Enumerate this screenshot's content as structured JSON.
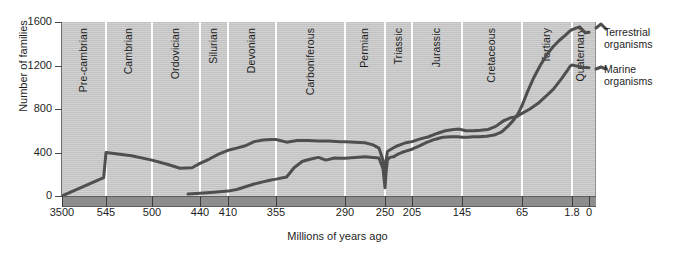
{
  "chart_data": {
    "type": "line",
    "title": "",
    "xlabel": "Millions of years ago",
    "ylabel": "Number of families",
    "ylim": [
      0,
      1600
    ],
    "y_ticks": [
      0,
      400,
      800,
      1200,
      1600
    ],
    "x_ticks": [
      "3500",
      "545",
      "500",
      "440",
      "410",
      "355",
      "290",
      "250",
      "205",
      "145",
      "65",
      "1.8",
      "0"
    ],
    "x_tick_values": [
      3500,
      545,
      500,
      440,
      410,
      355,
      290,
      250,
      205,
      145,
      65,
      1.8,
      0
    ],
    "x_axis_note": "Non-linear (piecewise) time axis: oldest at left, present at right",
    "grid": "vertical period dividers only",
    "legend_position": "right",
    "geologic_periods": [
      {
        "name": "Pre-cambrian",
        "start_ma": 3500,
        "end_ma": 545
      },
      {
        "name": "Cambrian",
        "start_ma": 545,
        "end_ma": 500
      },
      {
        "name": "Ordovician",
        "start_ma": 500,
        "end_ma": 440
      },
      {
        "name": "Silurian",
        "start_ma": 440,
        "end_ma": 410
      },
      {
        "name": "Devonian",
        "start_ma": 410,
        "end_ma": 355
      },
      {
        "name": "Carboniferous",
        "start_ma": 355,
        "end_ma": 290
      },
      {
        "name": "Permian",
        "start_ma": 290,
        "end_ma": 250
      },
      {
        "name": "Triassic",
        "start_ma": 250,
        "end_ma": 205
      },
      {
        "name": "Jurassic",
        "start_ma": 205,
        "end_ma": 145
      },
      {
        "name": "Cretaceous",
        "start_ma": 145,
        "end_ma": 65
      },
      {
        "name": "Tertiary",
        "start_ma": 65,
        "end_ma": 1.8
      },
      {
        "name": "Quaternary",
        "start_ma": 1.8,
        "end_ma": 0
      }
    ],
    "series": [
      {
        "name": "Marine organisms",
        "points": [
          [
            3500,
            0
          ],
          [
            700,
            170
          ],
          [
            545,
            400
          ],
          [
            520,
            370
          ],
          [
            500,
            330
          ],
          [
            480,
            290
          ],
          [
            465,
            255
          ],
          [
            450,
            260
          ],
          [
            440,
            300
          ],
          [
            430,
            340
          ],
          [
            420,
            385
          ],
          [
            410,
            420
          ],
          [
            400,
            440
          ],
          [
            390,
            462
          ],
          [
            380,
            500
          ],
          [
            370,
            515
          ],
          [
            360,
            520
          ],
          [
            355,
            520
          ],
          [
            345,
            495
          ],
          [
            335,
            510
          ],
          [
            325,
            510
          ],
          [
            315,
            505
          ],
          [
            305,
            505
          ],
          [
            295,
            500
          ],
          [
            290,
            500
          ],
          [
            280,
            495
          ],
          [
            270,
            490
          ],
          [
            262,
            470
          ],
          [
            256,
            440
          ],
          [
            252,
            330
          ],
          [
            250,
            195
          ],
          [
            248,
            330
          ],
          [
            246,
            410
          ],
          [
            240,
            430
          ],
          [
            232,
            455
          ],
          [
            225,
            470
          ],
          [
            215,
            490
          ],
          [
            205,
            500
          ],
          [
            195,
            525
          ],
          [
            185,
            545
          ],
          [
            175,
            575
          ],
          [
            165,
            600
          ],
          [
            155,
            612
          ],
          [
            148,
            615
          ],
          [
            140,
            600
          ],
          [
            130,
            600
          ],
          [
            120,
            605
          ],
          [
            110,
            612
          ],
          [
            100,
            640
          ],
          [
            90,
            690
          ],
          [
            80,
            720
          ],
          [
            72,
            730
          ],
          [
            65,
            760
          ],
          [
            55,
            800
          ],
          [
            45,
            850
          ],
          [
            35,
            915
          ],
          [
            25,
            985
          ],
          [
            15,
            1080
          ],
          [
            8,
            1150
          ],
          [
            4,
            1195
          ],
          [
            1.8,
            1205
          ],
          [
            0.8,
            1185
          ],
          [
            0,
            1180
          ]
        ]
      },
      {
        "name": "Terrestrial organisms",
        "points": [
          [
            455,
            18
          ],
          [
            440,
            25
          ],
          [
            425,
            35
          ],
          [
            410,
            45
          ],
          [
            400,
            60
          ],
          [
            390,
            85
          ],
          [
            380,
            110
          ],
          [
            370,
            130
          ],
          [
            362,
            145
          ],
          [
            355,
            155
          ],
          [
            345,
            175
          ],
          [
            338,
            260
          ],
          [
            330,
            320
          ],
          [
            322,
            340
          ],
          [
            315,
            355
          ],
          [
            308,
            330
          ],
          [
            300,
            350
          ],
          [
            295,
            348
          ],
          [
            290,
            348
          ],
          [
            280,
            355
          ],
          [
            270,
            360
          ],
          [
            262,
            355
          ],
          [
            256,
            350
          ],
          [
            252,
            250
          ],
          [
            250,
            75
          ],
          [
            248,
            230
          ],
          [
            246,
            330
          ],
          [
            242,
            355
          ],
          [
            236,
            360
          ],
          [
            230,
            380
          ],
          [
            222,
            400
          ],
          [
            214,
            415
          ],
          [
            205,
            430
          ],
          [
            196,
            460
          ],
          [
            188,
            490
          ],
          [
            178,
            520
          ],
          [
            168,
            540
          ],
          [
            158,
            545
          ],
          [
            150,
            545
          ],
          [
            145,
            540
          ],
          [
            138,
            540
          ],
          [
            130,
            545
          ],
          [
            122,
            545
          ],
          [
            112,
            550
          ],
          [
            102,
            560
          ],
          [
            92,
            590
          ],
          [
            84,
            640
          ],
          [
            76,
            700
          ],
          [
            70,
            760
          ],
          [
            65,
            830
          ],
          [
            58,
            960
          ],
          [
            50,
            1090
          ],
          [
            42,
            1200
          ],
          [
            34,
            1295
          ],
          [
            26,
            1370
          ],
          [
            18,
            1430
          ],
          [
            10,
            1480
          ],
          [
            4,
            1520
          ],
          [
            1.8,
            1530
          ],
          [
            1.0,
            1555
          ],
          [
            0.4,
            1500
          ],
          [
            0,
            1505
          ]
        ]
      }
    ],
    "annotations": [
      {
        "label": "Permian-Triassic mass extinction",
        "at_ma": 250
      }
    ]
  },
  "legend": {
    "terrestrial_line1": "Terrestrial",
    "terrestrial_line2": "organisms",
    "marine_line1": "Marine",
    "marine_line2": "organisms"
  },
  "colors": {
    "plot_background": "#c9c9c9",
    "curve": "#4f4f4f",
    "gridline": "#ffffff",
    "axis_bar": "#8d8d8d",
    "text": "#1e1e1e",
    "page_background": "#ffffff"
  }
}
